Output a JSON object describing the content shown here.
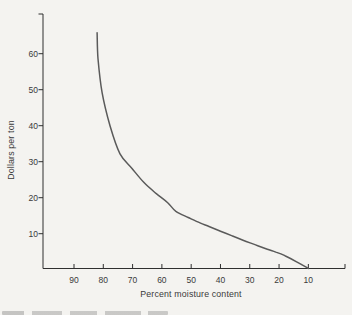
{
  "colors": {
    "background": "#f4f3f0",
    "ink": "#3a3a3a",
    "axis": "#2f2f2f",
    "curve": "#5a5a5a"
  },
  "chart_data": {
    "type": "line",
    "title": "",
    "xlabel": "Percent moisture content",
    "ylabel": "Dollars per ton",
    "x_axis": {
      "tick_labels": [
        90,
        80,
        70,
        60,
        50,
        40,
        30,
        20,
        10
      ],
      "direction": "reversed",
      "unlabeled_end_tick": true
    },
    "y_axis": {
      "tick_labels": [
        10,
        20,
        30,
        40,
        50,
        60
      ],
      "unlabeled_end_tick": true
    },
    "grid": "off",
    "legend": "none",
    "series": [
      {
        "name": "curve",
        "points_moisture_dollars": [
          [
            82.1,
            65.8
          ],
          [
            81.8,
            58.6
          ],
          [
            80.4,
            49.2
          ],
          [
            77.7,
            40.0
          ],
          [
            74.3,
            32.2
          ],
          [
            70.2,
            28.1
          ],
          [
            66.1,
            24.2
          ],
          [
            62.0,
            21.2
          ],
          [
            58.0,
            18.6
          ],
          [
            55.2,
            16.2
          ],
          [
            51.0,
            14.5
          ],
          [
            47.0,
            13.0
          ],
          [
            43.9,
            12.0
          ],
          [
            40.0,
            10.7
          ],
          [
            36.0,
            9.4
          ],
          [
            32.3,
            8.2
          ],
          [
            28.0,
            6.9
          ],
          [
            24.0,
            5.7
          ],
          [
            21.1,
            4.9
          ],
          [
            18.0,
            3.9
          ],
          [
            14.0,
            2.2
          ],
          [
            10.0,
            0.3
          ]
        ]
      }
    ]
  }
}
